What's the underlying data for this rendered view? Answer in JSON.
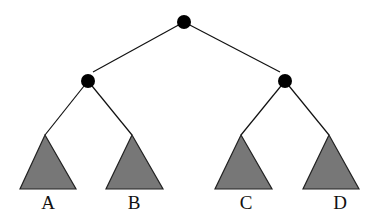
{
  "diagram": {
    "type": "binary-tree",
    "colors": {
      "background": "#ffffff",
      "node": "#000000",
      "edge": "#111111",
      "subtree_fill": "#777777",
      "subtree_stroke": "#222222",
      "label": "#111111"
    },
    "nodes": [
      {
        "id": "root",
        "x": 184,
        "y": 22,
        "r": 7
      },
      {
        "id": "left",
        "x": 88,
        "y": 81,
        "r": 7
      },
      {
        "id": "right",
        "x": 285,
        "y": 81,
        "r": 7
      }
    ],
    "edges": [
      {
        "from": "root",
        "to": "left",
        "x1": 184,
        "y1": 22,
        "x2": 93,
        "y2": 72
      },
      {
        "from": "root",
        "to": "right",
        "x1": 184,
        "y1": 22,
        "x2": 280,
        "y2": 72
      },
      {
        "from": "left",
        "to": "A",
        "x1": 88,
        "y1": 81,
        "x2": 45,
        "y2": 135
      },
      {
        "from": "left",
        "to": "B",
        "x1": 88,
        "y1": 81,
        "x2": 132,
        "y2": 135
      },
      {
        "from": "right",
        "to": "C",
        "x1": 285,
        "y1": 81,
        "x2": 241,
        "y2": 135
      },
      {
        "from": "right",
        "to": "D",
        "x1": 285,
        "y1": 81,
        "x2": 329,
        "y2": 135
      }
    ],
    "subtrees": [
      {
        "label": "A",
        "apex": [
          45,
          135
        ],
        "base_left": [
          20,
          189
        ],
        "base_right": [
          76,
          189
        ],
        "label_x": 48,
        "label_y": 209
      },
      {
        "label": "B",
        "apex": [
          132,
          135
        ],
        "base_left": [
          106,
          189
        ],
        "base_right": [
          163,
          189
        ],
        "label_x": 134,
        "label_y": 209
      },
      {
        "label": "C",
        "apex": [
          241,
          135
        ],
        "base_left": [
          215,
          189
        ],
        "base_right": [
          272,
          189
        ],
        "label_x": 246,
        "label_y": 209
      },
      {
        "label": "D",
        "apex": [
          329,
          135
        ],
        "base_left": [
          303,
          189
        ],
        "base_right": [
          359,
          189
        ],
        "label_x": 340,
        "label_y": 209
      }
    ]
  }
}
